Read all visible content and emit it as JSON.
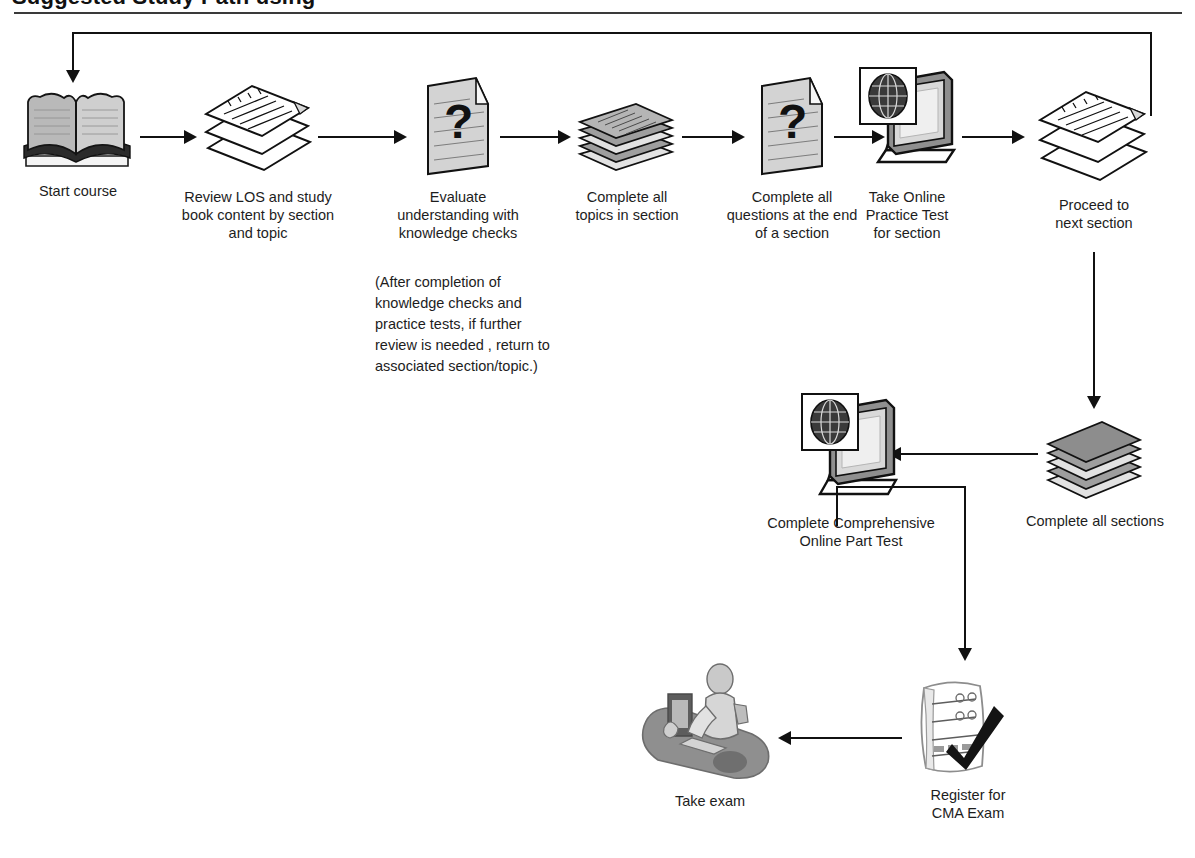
{
  "page": {
    "title_cropped": "Suggested Study Path using",
    "background": "#ffffff",
    "line_color": "#111111"
  },
  "diagram": {
    "type": "flowchart",
    "orientation": "left-to-right with feedback loop",
    "nodes": [
      {
        "id": "start",
        "icon": "open-book-icon",
        "label": "Start  course"
      },
      {
        "id": "review",
        "icon": "document-stack-icon",
        "label": "Review LOS and study\nbook content by section\nand topic"
      },
      {
        "id": "evaluate",
        "icon": "question-document-icon",
        "label": "Evaluate\nunderstanding with\nknowledge checks"
      },
      {
        "id": "topics",
        "icon": "book-stack-icon",
        "label": "Complete all\ntopics in section"
      },
      {
        "id": "questions",
        "icon": "question-document-icon",
        "label": "Complete all\nquestions at the end\nof a section"
      },
      {
        "id": "practice",
        "icon": "computer-globe-icon",
        "label": "Take Online\nPractice Test\nfor section"
      },
      {
        "id": "proceed",
        "icon": "document-stack-icon",
        "label": "Proceed to\nnext section"
      },
      {
        "id": "allsections",
        "icon": "book-stack-icon",
        "label": "Complete all sections"
      },
      {
        "id": "parttest",
        "icon": "computer-globe-icon",
        "label": "Complete Comprehensive\nOnline Part Test"
      },
      {
        "id": "register",
        "icon": "form-check-icon",
        "label": "Register for\nCMA Exam"
      },
      {
        "id": "takeexam",
        "icon": "person-at-desk-icon",
        "label": "Take  exam"
      }
    ],
    "note": "(After completion of\nknowledge checks and\npractice tests, if further\nreview is needed , return to\nassociated section/topic.)",
    "edges": [
      {
        "from": "start",
        "to": "review",
        "direction": "right"
      },
      {
        "from": "review",
        "to": "evaluate",
        "direction": "right"
      },
      {
        "from": "evaluate",
        "to": "topics",
        "direction": "right"
      },
      {
        "from": "topics",
        "to": "questions",
        "direction": "right"
      },
      {
        "from": "questions",
        "to": "practice",
        "direction": "right"
      },
      {
        "from": "practice",
        "to": "proceed",
        "direction": "right"
      },
      {
        "from": "proceed",
        "to": "allsections",
        "direction": "down"
      },
      {
        "from": "allsections",
        "to": "parttest",
        "direction": "left"
      },
      {
        "from": "parttest",
        "to": "register",
        "direction": "down"
      },
      {
        "from": "register",
        "to": "takeexam",
        "direction": "left"
      },
      {
        "from": "proceed",
        "to": "start",
        "direction": "feedback-loop-top"
      }
    ]
  }
}
